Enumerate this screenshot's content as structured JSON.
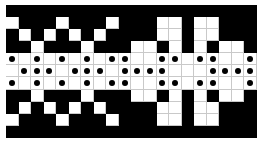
{
  "diagram": {
    "type": "weaving-draft-grid",
    "columns": 20,
    "rows": 11,
    "colors": {
      "filled": "#000000",
      "empty": "#ffffff",
      "dot": "#000000",
      "gridline": "#c9c9c9"
    },
    "legend": "1 = filled black cell, 0 = empty white cell, 2 = white cell with black dot",
    "matrix": [
      [
        1,
        1,
        1,
        1,
        1,
        1,
        1,
        1,
        1,
        1,
        1,
        1,
        1,
        1,
        1,
        1,
        1,
        1,
        1,
        1
      ],
      [
        0,
        1,
        1,
        1,
        0,
        1,
        1,
        1,
        0,
        1,
        1,
        1,
        0,
        0,
        1,
        0,
        0,
        1,
        1,
        1
      ],
      [
        1,
        0,
        1,
        0,
        1,
        0,
        1,
        0,
        1,
        1,
        1,
        1,
        0,
        0,
        1,
        0,
        0,
        1,
        1,
        1
      ],
      [
        1,
        1,
        0,
        1,
        1,
        1,
        0,
        1,
        1,
        1,
        0,
        0,
        1,
        0,
        1,
        0,
        1,
        0,
        0,
        1
      ],
      [
        2,
        0,
        2,
        0,
        2,
        0,
        2,
        0,
        2,
        2,
        0,
        0,
        2,
        2,
        0,
        2,
        2,
        0,
        0,
        2
      ],
      [
        0,
        2,
        2,
        2,
        0,
        2,
        2,
        2,
        0,
        2,
        2,
        2,
        2,
        0,
        0,
        0,
        2,
        2,
        2,
        2
      ],
      [
        2,
        0,
        2,
        0,
        2,
        0,
        2,
        0,
        2,
        2,
        0,
        0,
        2,
        2,
        0,
        2,
        2,
        0,
        0,
        2
      ],
      [
        1,
        1,
        0,
        1,
        1,
        1,
        0,
        1,
        1,
        1,
        0,
        0,
        1,
        0,
        1,
        0,
        1,
        0,
        0,
        1
      ],
      [
        1,
        0,
        1,
        0,
        1,
        0,
        1,
        0,
        1,
        1,
        1,
        1,
        0,
        0,
        1,
        0,
        0,
        1,
        1,
        1
      ],
      [
        0,
        1,
        1,
        1,
        0,
        1,
        1,
        1,
        0,
        1,
        1,
        1,
        0,
        0,
        1,
        0,
        0,
        1,
        1,
        1
      ],
      [
        1,
        1,
        1,
        1,
        1,
        1,
        1,
        1,
        1,
        1,
        1,
        1,
        1,
        1,
        1,
        1,
        1,
        1,
        1,
        1
      ]
    ]
  }
}
